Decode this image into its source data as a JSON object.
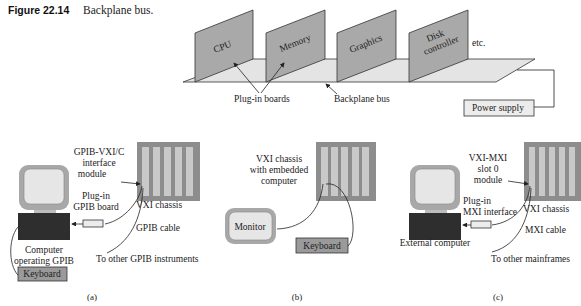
{
  "caption": {
    "label": "Figure 22.14",
    "text": "Backplane bus."
  },
  "top_diagram": {
    "boards": [
      "CPU",
      "Memory",
      "Graphics",
      "Disk",
      "controller"
    ],
    "etc": "etc.",
    "plug_in_boards": "Plug-in boards",
    "backplane_bus": "Backplane bus",
    "power_supply": "Power supply"
  },
  "panel_a": {
    "interface_l1": "GPIB-VXI/C",
    "interface_l2": "interface",
    "interface_l3": "module",
    "plugin_l1": "Plug-in",
    "plugin_l2": "GPIB board",
    "chassis": "VXI chassis",
    "cable": "GPIB cable",
    "computer_l1": "Computer",
    "computer_l2": "operating GPIB",
    "keyboard": "Keyboard",
    "other": "To other GPIB instruments",
    "tag": "(a)"
  },
  "panel_b": {
    "chassis_l1": "VXI chassis",
    "chassis_l2": "with embedded",
    "chassis_l3": "computer",
    "monitor": "Monitor",
    "keyboard": "Keyboard",
    "tag": "(b)"
  },
  "panel_c": {
    "module_l1": "VXI-MXI",
    "module_l2": "slot 0",
    "module_l3": "module",
    "plugin_l1": "Plug-in",
    "plugin_l2": "MXI interface",
    "chassis": "VXI chassis",
    "cable": "MXI cable",
    "computer": "External computer",
    "other": "To other mainframes",
    "tag": "(c)"
  },
  "colors": {
    "board": "#a9a9a9",
    "plane": "#e4e4e4",
    "chassis": "#8d8d8d",
    "slot": "#c9c9c9",
    "computer_base": "#2e2e2e"
  }
}
